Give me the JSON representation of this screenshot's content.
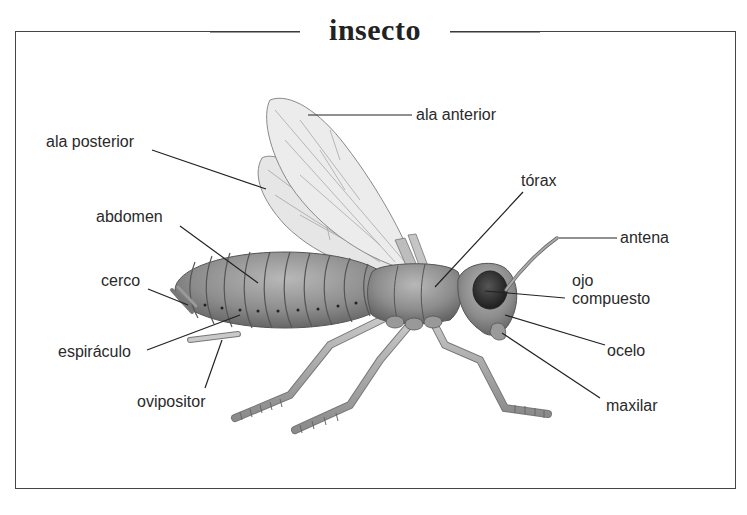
{
  "title": "insecto",
  "colors": {
    "frame": "#444444",
    "text": "#2a2a2a",
    "body_fill": "#8a8a8a",
    "wing_fill": "#e4e4e4",
    "leader_line": "#222222"
  },
  "labels": {
    "ala_anterior": "ala anterior",
    "ala_posterior": "ala posterior",
    "torax": "tórax",
    "abdomen": "abdomen",
    "antena": "antena",
    "cerco": "cerco",
    "ojo_compuesto_line1": "ojo",
    "ojo_compuesto_line2": "compuesto",
    "espiraculo": "espiráculo",
    "ocelo": "ocelo",
    "ovipositor": "ovipositor",
    "maxilar": "maxilar"
  }
}
